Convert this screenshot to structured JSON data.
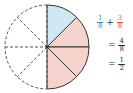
{
  "circle": {
    "cx": 47,
    "cy": 47,
    "r": 42,
    "total_parts": 8,
    "blue_parts": 1,
    "pink_parts": 3,
    "colors": {
      "blue": "#cfe8f3",
      "pink": "#f6d3cc",
      "stroke": "#333333"
    }
  },
  "equation": {
    "line1": {
      "a_num": "1",
      "a_den": "8",
      "op": "+",
      "b_num": "3",
      "b_den": "8",
      "a_color": "#2a8fc7",
      "b_color": "#d9534f"
    },
    "line2": {
      "eq": "=",
      "num": "4",
      "den": "8"
    },
    "line3": {
      "eq": "=",
      "num": "1",
      "den": "2"
    }
  }
}
